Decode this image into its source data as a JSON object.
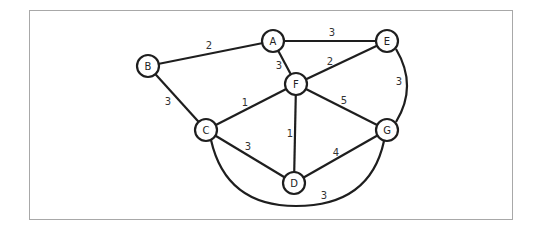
{
  "diagram": {
    "type": "weighted-undirected-graph",
    "nodes": [
      {
        "id": "A",
        "label": "A",
        "x": 273,
        "y": 41
      },
      {
        "id": "B",
        "label": "B",
        "x": 148,
        "y": 66
      },
      {
        "id": "C",
        "label": "C",
        "x": 206,
        "y": 130
      },
      {
        "id": "D",
        "label": "D",
        "x": 294,
        "y": 183
      },
      {
        "id": "E",
        "label": "E",
        "x": 387,
        "y": 41
      },
      {
        "id": "F",
        "label": "F",
        "x": 296,
        "y": 84
      },
      {
        "id": "G",
        "label": "G",
        "x": 387,
        "y": 130
      }
    ],
    "edges": [
      {
        "from": "B",
        "to": "A",
        "weight": "2",
        "label_x": 209,
        "label_y": 45
      },
      {
        "from": "A",
        "to": "E",
        "weight": "3",
        "label_x": 332,
        "label_y": 32
      },
      {
        "from": "A",
        "to": "F",
        "weight": "3",
        "label_x": 279,
        "label_y": 65
      },
      {
        "from": "F",
        "to": "E",
        "weight": "2",
        "label_x": 330,
        "label_y": 61
      },
      {
        "from": "B",
        "to": "C",
        "weight": "3",
        "label_x": 168,
        "label_y": 101
      },
      {
        "from": "C",
        "to": "F",
        "weight": "1",
        "label_x": 245,
        "label_y": 102
      },
      {
        "from": "F",
        "to": "D",
        "weight": "1",
        "label_x": 290,
        "label_y": 133
      },
      {
        "from": "F",
        "to": "G",
        "weight": "5",
        "label_x": 344,
        "label_y": 100
      },
      {
        "from": "C",
        "to": "D",
        "weight": "3",
        "label_x": 248,
        "label_y": 146
      },
      {
        "from": "D",
        "to": "G",
        "weight": "4",
        "label_x": 336,
        "label_y": 152
      },
      {
        "from": "E",
        "to": "G",
        "weight": "3",
        "label_x": 399,
        "label_y": 81,
        "curve": "M 396 49 Q 418 86 396 122"
      },
      {
        "from": "C",
        "to": "G",
        "weight": "3",
        "label_x": 324,
        "label_y": 195,
        "curve": "M 211 140 Q 226 206 296 206 Q 370 206 384 141"
      }
    ]
  }
}
